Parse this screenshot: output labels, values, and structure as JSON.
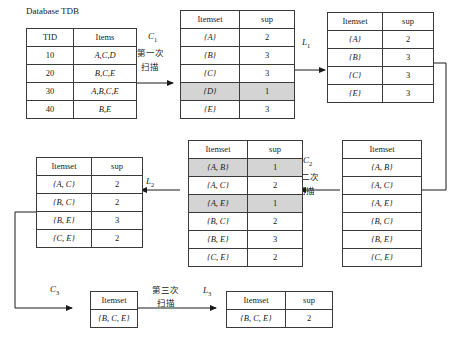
{
  "figure": {
    "caption": "Database TDB",
    "type": "apriori-diagram"
  },
  "tdb_table": {
    "name": "transaction-database",
    "headers": [
      "TID",
      "Items"
    ],
    "rows": [
      {
        "tid": "10",
        "items": "A,C,D"
      },
      {
        "tid": "20",
        "items": "B,C,E"
      },
      {
        "tid": "30",
        "items": "A,B,C,E"
      },
      {
        "tid": "40",
        "items": "B,E"
      }
    ]
  },
  "c1_table": {
    "name": "candidate-1-itemsets",
    "headers": [
      "Itemset",
      "sup"
    ],
    "rows": [
      {
        "itemset": "{A}",
        "sup": "2",
        "pruned": false
      },
      {
        "itemset": "{B}",
        "sup": "3",
        "pruned": false
      },
      {
        "itemset": "{C}",
        "sup": "3",
        "pruned": false
      },
      {
        "itemset": "{D}",
        "sup": "1",
        "pruned": true
      },
      {
        "itemset": "{E}",
        "sup": "3",
        "pruned": false
      }
    ]
  },
  "l1_table": {
    "name": "frequent-1-itemsets",
    "headers": [
      "Itemset",
      "sup"
    ],
    "rows": [
      {
        "itemset": "{A}",
        "sup": "2"
      },
      {
        "itemset": "{B}",
        "sup": "3"
      },
      {
        "itemset": "{C}",
        "sup": "3"
      },
      {
        "itemset": "{E}",
        "sup": "3"
      }
    ]
  },
  "c2_candidates_table": {
    "name": "candidate-2-itemsets-generated",
    "headers": [
      "Itemset"
    ],
    "rows": [
      {
        "itemset": "{A, B}"
      },
      {
        "itemset": "{A, C}"
      },
      {
        "itemset": "{A, E}"
      },
      {
        "itemset": "{B, C}"
      },
      {
        "itemset": "{B, E}"
      },
      {
        "itemset": "{C, E}"
      }
    ]
  },
  "c2_counted_table": {
    "name": "candidate-2-itemsets-counted",
    "headers": [
      "Itemset",
      "sup"
    ],
    "rows": [
      {
        "itemset": "{A, B}",
        "sup": "1",
        "pruned": true
      },
      {
        "itemset": "{A, C}",
        "sup": "2",
        "pruned": false
      },
      {
        "itemset": "{A, E}",
        "sup": "1",
        "pruned": true
      },
      {
        "itemset": "{B, C}",
        "sup": "2",
        "pruned": false
      },
      {
        "itemset": "{B, E}",
        "sup": "3",
        "pruned": false
      },
      {
        "itemset": "{C, E}",
        "sup": "2",
        "pruned": false
      }
    ]
  },
  "l2_table": {
    "name": "frequent-2-itemsets",
    "headers": [
      "Itemset",
      "sup"
    ],
    "rows": [
      {
        "itemset": "{A, C}",
        "sup": "2"
      },
      {
        "itemset": "{B, C}",
        "sup": "2"
      },
      {
        "itemset": "{B, E}",
        "sup": "3"
      },
      {
        "itemset": "{C, E}",
        "sup": "2"
      }
    ]
  },
  "c3_table": {
    "name": "candidate-3-itemsets",
    "headers": [
      "Itemset"
    ],
    "rows": [
      {
        "itemset": "{B, C, E}"
      }
    ]
  },
  "l3_table": {
    "name": "frequent-3-itemsets",
    "headers": [
      "Itemset",
      "sup"
    ],
    "rows": [
      {
        "itemset": "{B, C, E}",
        "sup": "2"
      }
    ]
  },
  "labels": {
    "c1": "C",
    "c1_sub": "1",
    "c2": "C",
    "c2_sub": "2",
    "c3": "C",
    "c3_sub": "3",
    "l1": "L",
    "l1_sub": "1",
    "l2": "L",
    "l2_sub": "2",
    "l3": "L",
    "l3_sub": "3",
    "scan1_line1": "第一次",
    "scan1_line2": "扫描",
    "scan2_line1": "第二次",
    "scan2_line2": "扫描",
    "scan3_line1": "第三次",
    "scan3_line2": "扫描"
  },
  "colors": {
    "line": "#3a3a3a",
    "shade": "#d4d4d4",
    "text": "#1a1a1a",
    "background": "#ffffff"
  }
}
